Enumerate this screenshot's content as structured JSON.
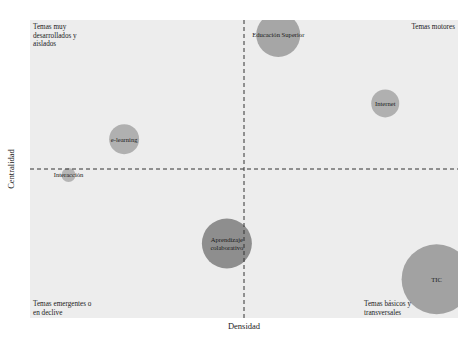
{
  "chart_data": {
    "type": "scatter",
    "subtype": "strategic-diagram-bubble",
    "xlabel": "Densidad",
    "ylabel": "Centralidad",
    "xlim": [
      0,
      100
    ],
    "ylim": [
      0,
      100
    ],
    "x_divider": 50,
    "y_divider": 50,
    "grid": false,
    "quadrants": [
      {
        "name": "top-left",
        "label": [
          "Temas muy",
          "desarrollados y",
          "aislados"
        ]
      },
      {
        "name": "top-right",
        "label": [
          "Temas motores"
        ]
      },
      {
        "name": "bottom-left",
        "label": [
          "Temas emergentes o",
          "en declive"
        ]
      },
      {
        "name": "bottom-right",
        "label": [
          "Temas básicos y",
          "transversales"
        ]
      }
    ],
    "points": [
      {
        "label": [
          "Educación Superior"
        ],
        "x": 58,
        "y": 95,
        "size": 22,
        "shade": "#a6a6a6"
      },
      {
        "label": [
          "Internet"
        ],
        "x": 83,
        "y": 72,
        "size": 14,
        "shade": "#b0b0b0"
      },
      {
        "label": [
          "e-learning"
        ],
        "x": 22,
        "y": 60,
        "size": 15,
        "shade": "#b0b0b0"
      },
      {
        "label": [
          "Interacción"
        ],
        "x": 9,
        "y": 48,
        "size": 7,
        "shade": "#b5b5b5"
      },
      {
        "label": [
          "Aprendizaje",
          "colaborativo"
        ],
        "x": 46,
        "y": 25,
        "size": 25,
        "shade": "#8e8e8e"
      },
      {
        "label": [
          "TIC"
        ],
        "x": 95,
        "y": 13,
        "size": 35,
        "shade": "#a2a2a2"
      }
    ]
  },
  "colors": {
    "panel": "#ededed",
    "divider": "#333333"
  }
}
